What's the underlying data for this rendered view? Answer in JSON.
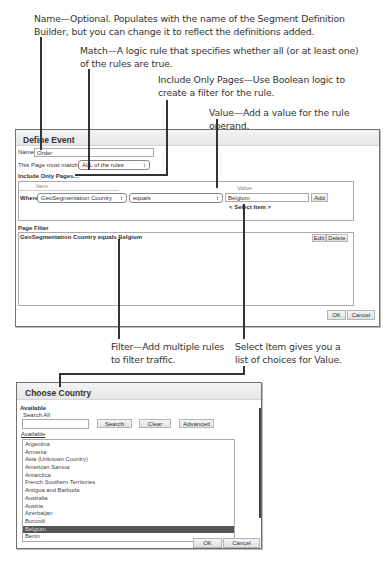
{
  "callouts": {
    "name": [
      "Name—Optional. Populates with the name of the Segment Definition",
      "Builder, but you can change it to reflect the definitions added."
    ],
    "match": [
      "Match—A logic rule that specifies whether all (or at least one)",
      "of the rules are true."
    ],
    "include": [
      "Include Only Pages—Use Boolean logic to",
      "create a filter for the rule."
    ],
    "value": [
      "Value—Add a value for the rule operand."
    ],
    "filter": [
      "Filter—Add multiple rules",
      "to filter traffic."
    ],
    "select_item": [
      "Select Item gives you a",
      "list of choices for Value."
    ]
  },
  "define_event": {
    "title": "Define Event",
    "name_label": "Name",
    "name_value": "Order",
    "match_label": "This Page must match:",
    "match_value": "ALL of the rules",
    "include_heading": "Include Only Pages...",
    "rule": {
      "item_header": "Item",
      "value_header": "Value",
      "where_label": "Where",
      "item_value": "GeoSegmentation Country",
      "operator_value": "equals",
      "value_value": "Belgium",
      "add_label": "Add",
      "select_item_label": "< Select Item >"
    },
    "page_filter": {
      "heading": "Page Filter",
      "rule_prefix": "GeoSegmentation Country equals ",
      "rule_value": "Belgium",
      "edit_label": "Edit",
      "delete_label": "Delete"
    },
    "ok_label": "OK",
    "cancel_label": "Cancel"
  },
  "choose_country": {
    "title": "Choose Country",
    "available_heading": "Available",
    "search_all_label": "Search All",
    "search_value": "",
    "search_label": "Search",
    "clear_label": "Clear",
    "advanced_label": "Advanced",
    "list_label": "Available",
    "countries": [
      "Argentina",
      "Armenia",
      "Asia (Unknown Country)",
      "American Samoa",
      "Antarctica",
      "French Southern Territories",
      "Antigua and Barbuda",
      "Australia",
      "Austria",
      "Azerbaijan",
      "Burundi",
      "Belgium",
      "Benin"
    ],
    "selected": "Belgium",
    "ok_label": "OK",
    "cancel_label": "Cancel"
  }
}
